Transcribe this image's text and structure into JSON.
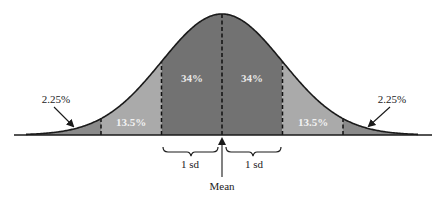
{
  "figure": {
    "mean_label": "Mean",
    "sd_labels": [
      "1 sd",
      "1 sd"
    ],
    "regions": [
      {
        "id": "far-left-tail",
        "label": "2.25%",
        "from_sd": -3,
        "to_sd": -2,
        "color": "#8a8a8a"
      },
      {
        "id": "left-13",
        "label": "13.5%",
        "from_sd": -2,
        "to_sd": -1,
        "color": "#aaaaaa"
      },
      {
        "id": "left-34",
        "label": "34%",
        "from_sd": -1,
        "to_sd": 0,
        "color": "#727272"
      },
      {
        "id": "right-34",
        "label": "34%",
        "from_sd": 0,
        "to_sd": 1,
        "color": "#727272"
      },
      {
        "id": "right-13",
        "label": "13.5%",
        "from_sd": 1,
        "to_sd": 2,
        "color": "#aaaaaa"
      },
      {
        "id": "far-right-tail",
        "label": "2.25%",
        "from_sd": 2,
        "to_sd": 3,
        "color": "#8a8a8a"
      }
    ],
    "colors": {
      "outline": "#1a1a1a",
      "inner_label": "#e8e8e8",
      "outer_label": "#222222",
      "background": "#ffffff"
    }
  },
  "chart_data": {
    "type": "area",
    "title": "",
    "xlabel": "Mean",
    "ylabel": "",
    "distribution": "normal",
    "x_sd_boundaries": [
      -3,
      -2,
      -1,
      0,
      1,
      2,
      3
    ],
    "categories": [
      "-3 to -2 sd",
      "-2 to -1 sd",
      "-1 to 0 sd",
      "0 to 1 sd",
      "1 to 2 sd",
      "2 to 3 sd"
    ],
    "values": [
      2.25,
      13.5,
      34,
      34,
      13.5,
      2.25
    ],
    "value_labels": [
      "2.25%",
      "13.5%",
      "34%",
      "34%",
      "13.5%",
      "2.25%"
    ],
    "annotations": [
      "Mean",
      "1 sd",
      "1 sd"
    ],
    "grid": false,
    "legend": "none"
  }
}
